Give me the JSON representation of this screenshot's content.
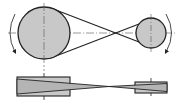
{
  "diagram": {
    "colors": {
      "pulley_fill": "#c8c8c8",
      "outline": "#222222",
      "centerline": "#555555",
      "background": "#ffffff"
    },
    "front_view": {
      "driver_pulley": {
        "cx": 44,
        "cy": 33,
        "r": 26
      },
      "driven_pulley": {
        "cx": 151,
        "cy": 33,
        "r": 15
      },
      "belt_crossing": {
        "x": 109,
        "y": 33
      },
      "rotation_arrows": [
        "left-arrow-downward",
        "right-arrow-downward"
      ]
    },
    "side_view": {
      "driver_pulley": {
        "x": 17,
        "y": 77,
        "w": 53,
        "h": 19
      },
      "driven_pulley": {
        "x": 135,
        "y": 82,
        "w": 32,
        "h": 11
      },
      "belt_crossing": {
        "x": 109,
        "y": 86
      }
    }
  }
}
